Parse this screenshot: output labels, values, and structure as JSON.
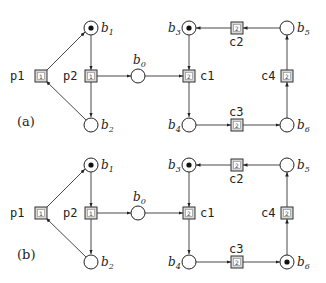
{
  "diagram": {
    "type": "petri-net",
    "panels": [
      {
        "label": "(a)",
        "places": [
          {
            "id": "b1",
            "name": "b",
            "sub": "1",
            "token": true
          },
          {
            "id": "b2",
            "name": "b",
            "sub": "2",
            "token": false
          },
          {
            "id": "b0",
            "name": "b",
            "sub": "0",
            "token": false
          },
          {
            "id": "b3",
            "name": "b",
            "sub": "3",
            "token": true
          },
          {
            "id": "b4",
            "name": "b",
            "sub": "4",
            "token": false
          },
          {
            "id": "b5",
            "name": "b",
            "sub": "5",
            "token": false
          },
          {
            "id": "b6",
            "name": "b",
            "sub": "6",
            "token": false
          }
        ],
        "transitions": [
          {
            "id": "p1",
            "label": "p1",
            "inner": "1"
          },
          {
            "id": "p2",
            "label": "p2",
            "inner": "1"
          },
          {
            "id": "c1",
            "label": "c1",
            "inner": "2"
          },
          {
            "id": "c2",
            "label": "c2",
            "inner": "2"
          },
          {
            "id": "c3",
            "label": "c3",
            "inner": "2"
          },
          {
            "id": "c4",
            "label": "c4",
            "inner": "2"
          }
        ]
      },
      {
        "label": "(b)",
        "places": [
          {
            "id": "b1",
            "name": "b",
            "sub": "1",
            "token": true
          },
          {
            "id": "b2",
            "name": "b",
            "sub": "2",
            "token": false
          },
          {
            "id": "b0",
            "name": "b",
            "sub": "0",
            "token": false
          },
          {
            "id": "b3",
            "name": "b",
            "sub": "3",
            "token": true
          },
          {
            "id": "b4",
            "name": "b",
            "sub": "4",
            "token": false
          },
          {
            "id": "b5",
            "name": "b",
            "sub": "5",
            "token": false
          },
          {
            "id": "b6",
            "name": "b",
            "sub": "6",
            "token": true
          }
        ],
        "transitions": [
          {
            "id": "p1",
            "label": "p1",
            "inner": "1"
          },
          {
            "id": "p2",
            "label": "p2",
            "inner": "1"
          },
          {
            "id": "c1",
            "label": "c1",
            "inner": "2"
          },
          {
            "id": "c2",
            "label": "c2",
            "inner": "2"
          },
          {
            "id": "c3",
            "label": "c3",
            "inner": "2"
          },
          {
            "id": "c4",
            "label": "c4",
            "inner": "2"
          }
        ]
      }
    ],
    "arcs": [
      [
        "p1",
        "b1"
      ],
      [
        "b2",
        "p1"
      ],
      [
        "b1",
        "p2"
      ],
      [
        "p2",
        "b2"
      ],
      [
        "p2",
        "b0"
      ],
      [
        "b0",
        "c1"
      ],
      [
        "b3",
        "c1"
      ],
      [
        "c1",
        "b4"
      ],
      [
        "b4",
        "c3"
      ],
      [
        "c3",
        "b6"
      ],
      [
        "b6",
        "c4"
      ],
      [
        "c4",
        "b5"
      ],
      [
        "b5",
        "c2"
      ],
      [
        "c2",
        "b3"
      ]
    ]
  }
}
